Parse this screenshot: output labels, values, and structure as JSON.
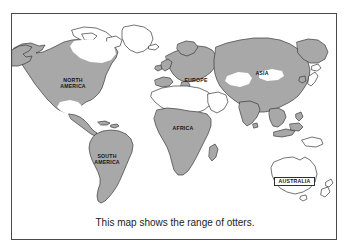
{
  "figure": {
    "caption": "This map shows the range of otters.",
    "colors": {
      "background": "#ffffff",
      "frame_border": "#4a4a4a",
      "land_outline": "#3a3a3a",
      "range_shading": "#a8a8a8",
      "unshaded_land": "#ffffff",
      "label_text": "#151515"
    }
  },
  "map": {
    "title_labels": [
      {
        "id": "north-america",
        "text": "NORTH\nAMERICA",
        "x": 41,
        "y": 64,
        "width": 40,
        "boxed": false
      },
      {
        "id": "south-america",
        "text": "SOUTH\nAMERICA",
        "x": 76,
        "y": 140,
        "width": 38,
        "boxed": false
      },
      {
        "id": "europe",
        "text": "EUROPE",
        "x": 168,
        "y": 64,
        "width": 32,
        "boxed": false
      },
      {
        "id": "asia",
        "text": "ASIA",
        "x": 239,
        "y": 57,
        "width": 22,
        "boxed": false
      },
      {
        "id": "africa",
        "text": "AFRICA",
        "x": 156,
        "y": 112,
        "width": 30,
        "boxed": false
      },
      {
        "id": "australia",
        "text": "AUSTRALIA",
        "x": 262,
        "y": 163,
        "width": 37,
        "boxed": true
      }
    ],
    "legend_note": "Shaded areas indicate the range of otters.",
    "shaded_regions": [
      "North America",
      "South America",
      "Europe",
      "Asia",
      "Sub-Saharan Africa"
    ],
    "unshaded_regions": [
      "Arctic Canada",
      "Greenland",
      "Southwestern North America",
      "Sahara",
      "Arabian Peninsula",
      "Central Asia",
      "Australia",
      "New Zealand",
      "Japan"
    ]
  }
}
